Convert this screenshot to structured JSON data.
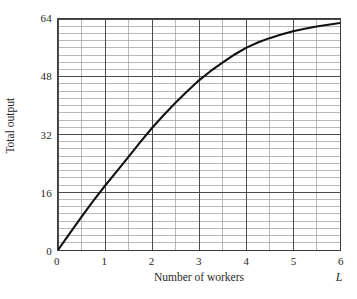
{
  "chart_data": {
    "type": "line",
    "title": "",
    "subtitle": "",
    "xlabel": "Number of workers",
    "ylabel": "Total output",
    "x_axis_variable": "L",
    "xlim": [
      0,
      6
    ],
    "ylim": [
      0,
      64
    ],
    "x_ticks": [
      "0",
      "1",
      "2",
      "3",
      "4",
      "5",
      "6"
    ],
    "x_tick_values": [
      0,
      1,
      2,
      3,
      4,
      5,
      6
    ],
    "y_ticks": [
      "0",
      "16",
      "32",
      "48",
      "64"
    ],
    "y_tick_values": [
      0,
      16,
      32,
      48,
      64
    ],
    "grid": true,
    "grid_minor_x_step": 0.5,
    "grid_minor_y_step": 2,
    "legend": "none",
    "series": [
      {
        "name": "Total output",
        "color": "#111111",
        "x": [
          0,
          0.25,
          0.5,
          0.75,
          1,
          1.25,
          1.5,
          1.75,
          2,
          2.25,
          2.5,
          2.75,
          3,
          3.25,
          3.5,
          3.75,
          4,
          4.25,
          4.5,
          4.75,
          5,
          5.25,
          5.5,
          5.75,
          6
        ],
        "values": [
          0,
          4.6,
          9.2,
          13.6,
          17.8,
          21.8,
          25.8,
          29.9,
          33.8,
          37.4,
          40.8,
          44.0,
          47.0,
          49.6,
          51.9,
          54.1,
          56.0,
          57.5,
          58.7,
          59.7,
          60.6,
          61.3,
          61.9,
          62.4,
          62.9
        ]
      }
    ],
    "key_points": {
      "0": 0,
      "1": 18,
      "2": 34,
      "3": 47,
      "4": 56,
      "5": 60,
      "6": 63
    },
    "colors": {
      "curve": "#111111",
      "grid_major": "#4a4a4a",
      "grid_minor": "#9a9a9a",
      "frame": "#3b3b3b",
      "background": "#ffffff",
      "text": "#1f1f1f"
    }
  }
}
